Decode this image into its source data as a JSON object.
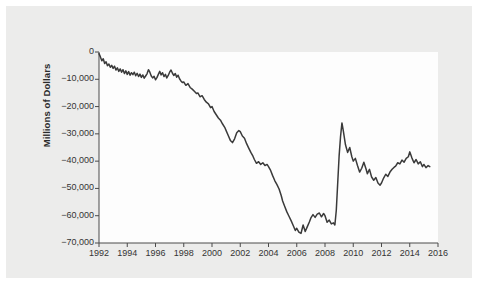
{
  "chart_data": {
    "type": "line",
    "title": "",
    "subtitle": "",
    "xlabel": "",
    "ylabel": "Millions of Dollars",
    "xlim": [
      1992,
      2016
    ],
    "ylim": [
      -70000,
      0
    ],
    "grid": false,
    "legend": null,
    "legend_position": "none",
    "line_color": "#3a3a3a",
    "background_color": "#ececeb",
    "plot_background_color": "#fdfdfd",
    "x_tick_labels": [
      "1992",
      "1994",
      "1996",
      "1998",
      "2000",
      "2002",
      "2004",
      "2006",
      "2008",
      "2010",
      "2012",
      "2014",
      "2016"
    ],
    "x_ticks": [
      1992,
      1994,
      1996,
      1998,
      2000,
      2002,
      2004,
      2006,
      2008,
      2010,
      2012,
      2014,
      2016
    ],
    "y_tick_labels": [
      "0",
      "−10,000",
      "−20,000",
      "−30,000",
      "−40,000",
      "−50,000",
      "−60,000",
      "−70,000"
    ],
    "y_ticks": [
      0,
      -10000,
      -20000,
      -30000,
      -40000,
      -50000,
      -60000,
      -70000
    ],
    "annotations": [],
    "series": [
      {
        "name": "Balance",
        "color": "#3a3a3a",
        "x": [
          1992.0,
          1992.1,
          1992.2,
          1992.3,
          1992.4,
          1992.5,
          1992.6,
          1992.7,
          1992.8,
          1992.9,
          1993.0,
          1993.1,
          1993.2,
          1993.3,
          1993.4,
          1993.5,
          1993.6,
          1993.7,
          1993.8,
          1993.9,
          1994.0,
          1994.1,
          1994.2,
          1994.3,
          1994.4,
          1994.5,
          1994.6,
          1994.7,
          1994.8,
          1994.9,
          1995.0,
          1995.1,
          1995.2,
          1995.3,
          1995.4,
          1995.5,
          1995.6,
          1995.7,
          1995.8,
          1995.9,
          1996.0,
          1996.1,
          1996.2,
          1996.3,
          1996.4,
          1996.5,
          1996.6,
          1996.7,
          1996.8,
          1996.9,
          1997.0,
          1997.1,
          1997.2,
          1997.3,
          1997.4,
          1997.5,
          1997.6,
          1997.7,
          1997.8,
          1997.9,
          1998.0,
          1998.15,
          1998.3,
          1998.45,
          1998.6,
          1998.75,
          1998.9,
          1999.0,
          1999.15,
          1999.3,
          1999.45,
          1999.6,
          1999.75,
          1999.9,
          2000.0,
          2000.15,
          2000.3,
          2000.45,
          2000.6,
          2000.75,
          2000.9,
          2001.0,
          2001.15,
          2001.3,
          2001.45,
          2001.6,
          2001.75,
          2001.9,
          2002.0,
          2002.15,
          2002.3,
          2002.45,
          2002.6,
          2002.75,
          2002.9,
          2003.0,
          2003.15,
          2003.3,
          2003.45,
          2003.6,
          2003.75,
          2003.9,
          2004.0,
          2004.15,
          2004.3,
          2004.45,
          2004.6,
          2004.75,
          2004.9,
          2005.0,
          2005.15,
          2005.3,
          2005.45,
          2005.6,
          2005.75,
          2005.9,
          2006.0,
          2006.15,
          2006.3,
          2006.45,
          2006.6,
          2006.75,
          2006.9,
          2007.0,
          2007.15,
          2007.3,
          2007.45,
          2007.6,
          2007.75,
          2007.9,
          2008.0,
          2008.15,
          2008.3,
          2008.45,
          2008.6,
          2008.7,
          2008.8,
          2008.9,
          2009.0,
          2009.1,
          2009.2,
          2009.3,
          2009.45,
          2009.6,
          2009.75,
          2009.9,
          2010.0,
          2010.15,
          2010.3,
          2010.45,
          2010.6,
          2010.75,
          2010.9,
          2011.0,
          2011.15,
          2011.3,
          2011.45,
          2011.6,
          2011.75,
          2011.9,
          2012.0,
          2012.15,
          2012.3,
          2012.45,
          2012.6,
          2012.75,
          2012.9,
          2013.0,
          2013.15,
          2013.3,
          2013.45,
          2013.6,
          2013.75,
          2013.9,
          2014.0,
          2014.15,
          2014.3,
          2014.45,
          2014.6,
          2014.75,
          2014.9,
          2015.0,
          2015.15,
          2015.3,
          2015.42
        ],
        "y": [
          -600,
          -1800,
          -3200,
          -2500,
          -4200,
          -3600,
          -5000,
          -4400,
          -5600,
          -4900,
          -6000,
          -5200,
          -6600,
          -5800,
          -7100,
          -6200,
          -7400,
          -6500,
          -7900,
          -6900,
          -8200,
          -7200,
          -8500,
          -7600,
          -8300,
          -7400,
          -8700,
          -7800,
          -9000,
          -8100,
          -9300,
          -8400,
          -9600,
          -8800,
          -8000,
          -6500,
          -7400,
          -8800,
          -9500,
          -8900,
          -10200,
          -9400,
          -8200,
          -7100,
          -8400,
          -7600,
          -9000,
          -8200,
          -9500,
          -8600,
          -7400,
          -6600,
          -7800,
          -8600,
          -7900,
          -9200,
          -8500,
          -9800,
          -10600,
          -11200,
          -11000,
          -12200,
          -11600,
          -13000,
          -13600,
          -14400,
          -15200,
          -15000,
          -16400,
          -16000,
          -17400,
          -18400,
          -19000,
          -20400,
          -20000,
          -21800,
          -23000,
          -24200,
          -25000,
          -26400,
          -27600,
          -28800,
          -30600,
          -32400,
          -33200,
          -31800,
          -29600,
          -28800,
          -29200,
          -30800,
          -31600,
          -33600,
          -35200,
          -36800,
          -38200,
          -39400,
          -40800,
          -40200,
          -41200,
          -40600,
          -41600,
          -41200,
          -42000,
          -43400,
          -45400,
          -47200,
          -48600,
          -50200,
          -52600,
          -54600,
          -56600,
          -58600,
          -60200,
          -61800,
          -63600,
          -65400,
          -64600,
          -66000,
          -66500,
          -63400,
          -65800,
          -64000,
          -62200,
          -60800,
          -59600,
          -60600,
          -59400,
          -59000,
          -60400,
          -59200,
          -60000,
          -62400,
          -61600,
          -63000,
          -62600,
          -63400,
          -58000,
          -48000,
          -38000,
          -31000,
          -26000,
          -29000,
          -34000,
          -36800,
          -35000,
          -38400,
          -40000,
          -39000,
          -41600,
          -44000,
          -42600,
          -40400,
          -42800,
          -44600,
          -43000,
          -45800,
          -47000,
          -46000,
          -48000,
          -48800,
          -48000,
          -46200,
          -44800,
          -45600,
          -44000,
          -43000,
          -42200,
          -41800,
          -40600,
          -41000,
          -39600,
          -40400,
          -39000,
          -38400,
          -36600,
          -38800,
          -40600,
          -39400,
          -41000,
          -40200,
          -42000,
          -41200,
          -42400,
          -41600,
          -42000
        ]
      }
    ]
  },
  "axis": {
    "y_title": "Millions of Dollars"
  }
}
